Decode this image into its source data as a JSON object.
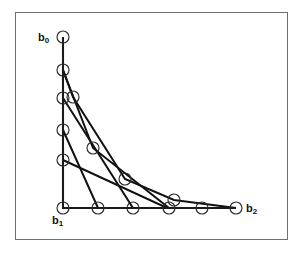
{
  "figure": {
    "title": "",
    "background_color": "#ffffff",
    "frame_color": "#6f6f6f",
    "line_color": "#111111",
    "marker_color": "#2b2b2b",
    "labels": {
      "b0": {
        "base": "b",
        "sub": "0"
      },
      "b1": {
        "base": "b",
        "sub": "1"
      },
      "b2": {
        "base": "b",
        "sub": "2"
      }
    }
  },
  "chart_data": {
    "type": "line",
    "title": "",
    "xlabel": "",
    "ylabel": "",
    "grid": false,
    "legend": "none",
    "xlim": [
      63,
      236
    ],
    "ylim": [
      37,
      208
    ],
    "axes": {
      "vertical": {
        "x": 63,
        "y_top": 37,
        "y_bottom": 208
      },
      "horizontal": {
        "y": 208,
        "x_left": 63,
        "x_right": 236
      }
    },
    "anchors": {
      "b0": {
        "x": 63,
        "y": 37
      },
      "b1": {
        "x": 63,
        "y": 208
      },
      "b2": {
        "x": 236,
        "y": 208
      }
    },
    "series": [
      {
        "name": "polygon-degree-2",
        "values": [
          {
            "x": 63,
            "y": 37
          },
          {
            "x": 63,
            "y": 208
          },
          {
            "x": 236,
            "y": 208
          }
        ]
      },
      {
        "name": "polygon-degree-3",
        "values": [
          {
            "x": 63,
            "y": 37
          },
          {
            "x": 63,
            "y": 98
          },
          {
            "x": 133,
            "y": 208
          },
          {
            "x": 236,
            "y": 208
          }
        ]
      },
      {
        "name": "polygon-degree-4",
        "values": [
          {
            "x": 63,
            "y": 37
          },
          {
            "x": 63,
            "y": 70
          },
          {
            "x": 93,
            "y": 148
          },
          {
            "x": 169,
            "y": 208
          },
          {
            "x": 236,
            "y": 208
          }
        ]
      },
      {
        "name": "polygon-degree-5",
        "values": [
          {
            "x": 63,
            "y": 37
          },
          {
            "x": 63,
            "y": 70
          },
          {
            "x": 73,
            "y": 97
          },
          {
            "x": 125,
            "y": 179
          },
          {
            "x": 174,
            "y": 200
          },
          {
            "x": 236,
            "y": 208
          }
        ]
      },
      {
        "name": "polygon-degree-6",
        "values": [
          {
            "x": 63,
            "y": 37
          },
          {
            "x": 63,
            "y": 130
          },
          {
            "x": 98,
            "y": 208
          },
          {
            "x": 202,
            "y": 208
          },
          {
            "x": 236,
            "y": 208
          }
        ]
      },
      {
        "name": "polygon-degree-7",
        "values": [
          {
            "x": 63,
            "y": 160
          },
          {
            "x": 167,
            "y": 208
          },
          {
            "x": 202,
            "y": 208
          }
        ]
      }
    ],
    "control_points": [
      {
        "id": "cp-b0",
        "x": 63,
        "y": 37,
        "on_axis": "vertical"
      },
      {
        "id": "cp-v1",
        "x": 63,
        "y": 70,
        "on_axis": "vertical"
      },
      {
        "id": "cp-v2",
        "x": 63,
        "y": 98,
        "on_axis": "vertical"
      },
      {
        "id": "cp-v3",
        "x": 63,
        "y": 130,
        "on_axis": "vertical"
      },
      {
        "id": "cp-v4",
        "x": 63,
        "y": 160,
        "on_axis": "vertical"
      },
      {
        "id": "cp-b1",
        "x": 63,
        "y": 208,
        "on_axis": "origin"
      },
      {
        "id": "cp-off1",
        "x": 73,
        "y": 97,
        "on_axis": "none"
      },
      {
        "id": "cp-off2",
        "x": 93,
        "y": 148,
        "on_axis": "none"
      },
      {
        "id": "cp-off3",
        "x": 125,
        "y": 179,
        "on_axis": "none"
      },
      {
        "id": "cp-off4",
        "x": 174,
        "y": 200,
        "on_axis": "none"
      },
      {
        "id": "cp-h1",
        "x": 98,
        "y": 208,
        "on_axis": "horizontal"
      },
      {
        "id": "cp-h2",
        "x": 133,
        "y": 208,
        "on_axis": "horizontal"
      },
      {
        "id": "cp-h3",
        "x": 169,
        "y": 208,
        "on_axis": "horizontal"
      },
      {
        "id": "cp-h4",
        "x": 202,
        "y": 208,
        "on_axis": "horizontal"
      },
      {
        "id": "cp-b2",
        "x": 236,
        "y": 208,
        "on_axis": "horizontal"
      }
    ],
    "marker": {
      "shape": "circle",
      "radius": 6,
      "filled": false
    }
  }
}
